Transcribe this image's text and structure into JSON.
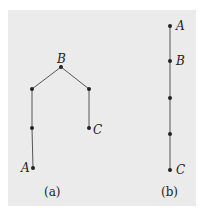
{
  "diagrams": [
    {
      "caption": "(a)",
      "nodes": [
        {
          "id": "B",
          "label": "B",
          "x": 61,
          "y": 67
        },
        {
          "id": "L1",
          "label": "",
          "x": 32,
          "y": 89
        },
        {
          "id": "L2",
          "label": "",
          "x": 32,
          "y": 128
        },
        {
          "id": "A",
          "label": "A",
          "x": 33,
          "y": 168
        },
        {
          "id": "R1",
          "label": "",
          "x": 89,
          "y": 89
        },
        {
          "id": "C",
          "label": "C",
          "x": 89,
          "y": 128
        }
      ],
      "edges": [
        [
          "B",
          "L1"
        ],
        [
          "L1",
          "L2"
        ],
        [
          "L2",
          "A"
        ],
        [
          "B",
          "R1"
        ],
        [
          "R1",
          "C"
        ]
      ]
    },
    {
      "caption": "(b)",
      "nodes": [
        {
          "id": "A",
          "label": "A",
          "x": 170,
          "y": 26
        },
        {
          "id": "B",
          "label": "B",
          "x": 170,
          "y": 61
        },
        {
          "id": "M1",
          "label": "",
          "x": 170,
          "y": 98
        },
        {
          "id": "M2",
          "label": "",
          "x": 170,
          "y": 134
        },
        {
          "id": "C",
          "label": "C",
          "x": 170,
          "y": 170
        }
      ],
      "edges": [
        [
          "A",
          "B"
        ],
        [
          "B",
          "M1"
        ],
        [
          "M1",
          "M2"
        ],
        [
          "M2",
          "C"
        ]
      ]
    }
  ],
  "colors": {
    "background": "#ebebeb",
    "ink": "#222222",
    "line": "#555555"
  }
}
